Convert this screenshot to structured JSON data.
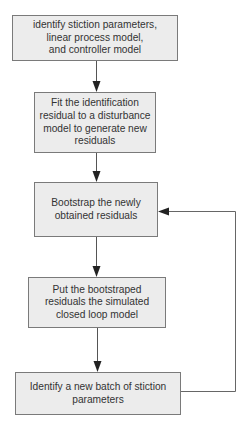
{
  "diagram": {
    "type": "flowchart",
    "direction": "top-to-bottom",
    "colors": {
      "box_fill": "#ececec",
      "box_border": "#7a7a7a",
      "line": "#555555",
      "arrowhead": "#222222",
      "text": "#333333"
    },
    "nodes": [
      {
        "id": "step1",
        "lines": [
          "identify stiction parameters,",
          "linear process model,",
          "and controller model"
        ]
      },
      {
        "id": "step2",
        "lines": [
          "Fit the identification",
          "residual to a disturbance",
          "model to generate new",
          "residuals"
        ]
      },
      {
        "id": "step3",
        "lines": [
          "Bootstrap the newly",
          "obtained residuals"
        ]
      },
      {
        "id": "step4",
        "lines": [
          "Put the bootstraped",
          "residuals the simulated",
          "closed loop model"
        ]
      },
      {
        "id": "step5",
        "lines": [
          "Identify a new batch of stiction",
          "parameters"
        ]
      }
    ],
    "edges": [
      {
        "from": "step1",
        "to": "step2"
      },
      {
        "from": "step2",
        "to": "step3"
      },
      {
        "from": "step3",
        "to": "step4"
      },
      {
        "from": "step4",
        "to": "step5"
      },
      {
        "from": "step5",
        "to": "step3",
        "kind": "feedback-loop-right"
      }
    ]
  }
}
